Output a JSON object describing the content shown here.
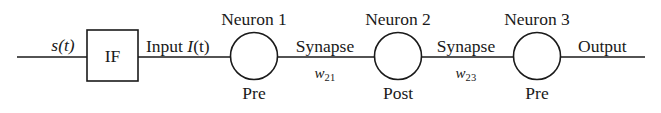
{
  "figure": {
    "type": "block-diagram",
    "background_color": "#ffffff",
    "line_color": "#1a1a1a",
    "text_color": "#1a1a1a"
  },
  "input": {
    "signal_label": "s(t)",
    "signal_label_plain": "s(t)",
    "signal_var": "s",
    "signal_arg": "(t)"
  },
  "if_block": {
    "label": "IF",
    "shape": "rectangle",
    "x": 87,
    "y": 30,
    "width": 51,
    "height": 51
  },
  "input_current": {
    "prefix": "Input ",
    "var": "I",
    "arg": "(t)"
  },
  "nodes": [
    {
      "id": "neuron-1",
      "title": "Neuron 1",
      "role": "Pre",
      "cx": 254,
      "cy": 56,
      "r": 23.5
    },
    {
      "id": "neuron-2",
      "title": "Neuron 2",
      "role": "Post",
      "cx": 398,
      "cy": 56,
      "r": 23.5
    },
    {
      "id": "neuron-3",
      "title": "Neuron 3",
      "role": "Pre",
      "cx": 537,
      "cy": 56,
      "r": 23.5
    }
  ],
  "synapses": [
    {
      "id": "synapse-21",
      "label": "Synapse",
      "weight_var": "w",
      "weight_sub": "21",
      "weight_full": "w21",
      "from": "neuron-1",
      "to": "neuron-2",
      "x_center": 325
    },
    {
      "id": "synapse-23",
      "label": "Synapse",
      "weight_var": "w",
      "weight_sub": "23",
      "weight_full": "w23",
      "from": "neuron-2",
      "to": "neuron-3",
      "x_center": 466
    }
  ],
  "output": {
    "label": "Output"
  }
}
